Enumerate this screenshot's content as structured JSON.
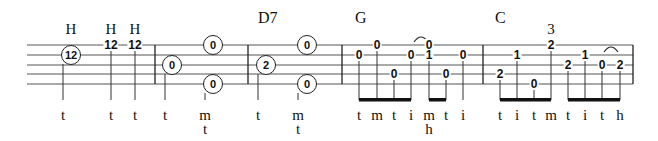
{
  "staff": {
    "lines_y": [
      45,
      55,
      65,
      74,
      84
    ],
    "x_start": 27,
    "x_end": 633,
    "barlines_x": [
      155,
      248,
      342,
      483,
      633
    ]
  },
  "chords": [
    {
      "label": "D7",
      "x": 258,
      "y": 10
    },
    {
      "label": "G",
      "x": 355,
      "y": 10
    },
    {
      "label": "C",
      "x": 495,
      "y": 10
    }
  ],
  "technique_marks": [
    {
      "label": "H",
      "x": 71,
      "y": 22
    },
    {
      "label": "H",
      "x": 111,
      "y": 22
    },
    {
      "label": "H",
      "x": 135,
      "y": 22
    },
    {
      "label": "3",
      "x": 551,
      "y": 22
    }
  ],
  "notes": [
    {
      "fret": "12",
      "x": 71,
      "string": 1,
      "circled": true,
      "stem_x": 63,
      "finger": "t"
    },
    {
      "fret": "12",
      "x": 111,
      "string": 0,
      "circled": false,
      "stem_x": 111,
      "finger": "t"
    },
    {
      "fret": "12",
      "x": 135,
      "string": 0,
      "circled": false,
      "stem_x": 135,
      "finger": "t"
    },
    {
      "fret": "0",
      "x": 172,
      "string": 2,
      "circled": true,
      "stem_x": 165,
      "finger": "t"
    },
    {
      "fret": "0",
      "x": 213,
      "string": 0,
      "circled": true,
      "stem_x": null,
      "finger": null
    },
    {
      "fret": "0",
      "x": 213,
      "string": 4,
      "circled": true,
      "stem_x": 205,
      "finger": "m",
      "finger2": "t"
    },
    {
      "fret": "2",
      "x": 266,
      "string": 2,
      "circled": true,
      "stem_x": 258,
      "finger": "t"
    },
    {
      "fret": "0",
      "x": 307,
      "string": 0,
      "circled": true,
      "stem_x": null,
      "finger": null
    },
    {
      "fret": "0",
      "x": 307,
      "string": 4,
      "circled": true,
      "stem_x": 298,
      "finger": "m",
      "finger2": "t"
    },
    {
      "fret": "0",
      "x": 359,
      "string": 1,
      "circled": false,
      "stem_x": 359,
      "finger": "t"
    },
    {
      "fret": "0",
      "x": 377,
      "string": 0,
      "circled": false,
      "stem_x": 377,
      "finger": "m"
    },
    {
      "fret": "0",
      "x": 394,
      "string": 3,
      "circled": false,
      "stem_x": 394,
      "finger": "t"
    },
    {
      "fret": "0",
      "x": 411,
      "string": 1,
      "circled": false,
      "stem_x": 411,
      "finger": "i"
    },
    {
      "fret": "0",
      "x": 429,
      "string": 0,
      "circled": false,
      "stem_x": null,
      "finger": null
    },
    {
      "fret": "1",
      "x": 429,
      "string": 1,
      "circled": false,
      "stem_x": 429,
      "finger": "m",
      "finger2": "h"
    },
    {
      "fret": "0",
      "x": 446,
      "string": 3,
      "circled": false,
      "stem_x": 446,
      "finger": "t"
    },
    {
      "fret": "0",
      "x": 463,
      "string": 1,
      "circled": false,
      "stem_x": 463,
      "finger": "i"
    },
    {
      "fret": "2",
      "x": 500,
      "string": 3,
      "circled": false,
      "stem_x": 500,
      "finger": "t"
    },
    {
      "fret": "1",
      "x": 517,
      "string": 1,
      "circled": false,
      "stem_x": 517,
      "finger": "i"
    },
    {
      "fret": "0",
      "x": 534,
      "string": 4,
      "circled": false,
      "stem_x": 534,
      "finger": "t"
    },
    {
      "fret": "2",
      "x": 551,
      "string": 0,
      "circled": false,
      "stem_x": 551,
      "finger": "m"
    },
    {
      "fret": "2",
      "x": 568,
      "string": 2,
      "circled": false,
      "stem_x": 568,
      "finger": "t"
    },
    {
      "fret": "1",
      "x": 585,
      "string": 1,
      "circled": false,
      "stem_x": 585,
      "finger": "i"
    },
    {
      "fret": "0",
      "x": 602,
      "string": 2,
      "circled": false,
      "stem_x": 602,
      "finger": "t"
    },
    {
      "fret": "2",
      "x": 620,
      "string": 2,
      "circled": false,
      "stem_x": 620,
      "finger": "h"
    }
  ],
  "beams": [
    {
      "x1": 359,
      "x2": 411
    },
    {
      "x1": 429,
      "x2": 446
    },
    {
      "x1": 500,
      "x2": 551
    },
    {
      "x1": 568,
      "x2": 620
    }
  ],
  "slurs": [
    {
      "x1": 414,
      "x2": 428,
      "y": 42
    },
    {
      "x1": 604,
      "x2": 618,
      "y": 52
    }
  ]
}
